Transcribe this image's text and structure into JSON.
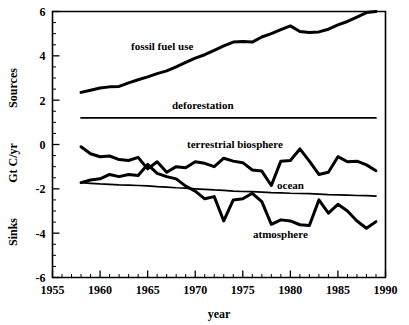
{
  "chart_data": {
    "type": "line",
    "title": "",
    "xlabel": "year",
    "ylabel": "Sinks   Gt C/yr   Sources",
    "ylabel_parts": [
      "Sinks",
      "Gt C/yr",
      "Sources"
    ],
    "xlim": [
      1955,
      1990
    ],
    "ylim": [
      -6,
      6
    ],
    "grid": false,
    "legend": "inline-annotations",
    "x_ticks_major": [
      1955,
      1960,
      1965,
      1970,
      1975,
      1980,
      1985,
      1990
    ],
    "x_tick_labels": [
      "1955",
      "1960",
      "1965",
      "1970",
      "1975",
      "1980",
      "1985",
      "1990"
    ],
    "x_tick_minor_step": 1,
    "y_ticks_major": [
      6,
      4,
      2,
      0,
      -2,
      -4,
      -6
    ],
    "y_tick_labels": [
      "6",
      "4",
      "2",
      "0",
      "-2",
      "-4",
      "-6"
    ],
    "y_tick_minor_step": 0.5,
    "x": [
      1958,
      1959,
      1960,
      1961,
      1962,
      1963,
      1964,
      1965,
      1966,
      1967,
      1968,
      1969,
      1970,
      1971,
      1972,
      1973,
      1974,
      1975,
      1976,
      1977,
      1978,
      1979,
      1980,
      1981,
      1982,
      1983,
      1984,
      1985,
      1986,
      1987,
      1988,
      1989
    ],
    "series": [
      {
        "name": "fossil fuel use",
        "label": "fossil fuel use",
        "style": "thick",
        "values": [
          2.35,
          2.45,
          2.55,
          2.6,
          2.62,
          2.78,
          2.92,
          3.05,
          3.2,
          3.32,
          3.5,
          3.7,
          3.9,
          4.05,
          4.25,
          4.45,
          4.62,
          4.65,
          4.62,
          4.85,
          5.0,
          5.18,
          5.35,
          5.1,
          5.05,
          5.08,
          5.2,
          5.4,
          5.55,
          5.75,
          5.95,
          6.0
        ]
      },
      {
        "name": "deforestation",
        "label": "deforestation",
        "style": "thin",
        "values": [
          1.2,
          1.2,
          1.2,
          1.2,
          1.2,
          1.2,
          1.2,
          1.2,
          1.2,
          1.2,
          1.2,
          1.2,
          1.2,
          1.2,
          1.2,
          1.2,
          1.2,
          1.2,
          1.2,
          1.2,
          1.2,
          1.2,
          1.2,
          1.2,
          1.2,
          1.2,
          1.2,
          1.2,
          1.2,
          1.2,
          1.2,
          1.2
        ]
      },
      {
        "name": "terrestrial biosphere",
        "label": "terrestrial biosphere",
        "style": "thick",
        "values": [
          -0.1,
          -0.42,
          -0.55,
          -0.52,
          -0.68,
          -0.72,
          -0.58,
          -1.1,
          -0.78,
          -1.25,
          -1.0,
          -1.05,
          -0.78,
          -0.85,
          -1.0,
          -0.62,
          -0.75,
          -0.82,
          -1.15,
          -1.2,
          -1.85,
          -0.75,
          -0.72,
          -0.2,
          -0.75,
          -1.35,
          -1.25,
          -0.55,
          -0.78,
          -0.75,
          -0.92,
          -1.18
        ]
      },
      {
        "name": "ocean",
        "label": "ocean",
        "style": "thin",
        "values": [
          -1.72,
          -1.75,
          -1.78,
          -1.8,
          -1.82,
          -1.83,
          -1.85,
          -1.87,
          -1.9,
          -1.92,
          -1.95,
          -1.97,
          -2.0,
          -2.02,
          -2.05,
          -2.07,
          -2.1,
          -2.12,
          -2.13,
          -2.15,
          -2.17,
          -2.18,
          -2.2,
          -2.21,
          -2.22,
          -2.24,
          -2.26,
          -2.27,
          -2.28,
          -2.3,
          -2.31,
          -2.33
        ]
      },
      {
        "name": "atmosphere",
        "label": "atmosphere",
        "style": "thick",
        "values": [
          -1.72,
          -1.6,
          -1.55,
          -1.35,
          -1.45,
          -1.35,
          -1.4,
          -0.9,
          -1.3,
          -1.45,
          -1.55,
          -1.88,
          -2.1,
          -2.45,
          -2.35,
          -3.45,
          -2.5,
          -2.45,
          -2.2,
          -2.58,
          -3.6,
          -3.4,
          -3.45,
          -3.62,
          -3.65,
          -2.5,
          -3.1,
          -2.7,
          -3.0,
          -3.45,
          -3.78,
          -3.48
        ]
      }
    ],
    "annotations": [
      {
        "text": "fossil fuel use",
        "x_px": 131,
        "y_px": 50
      },
      {
        "text": "deforestation",
        "x_px": 172,
        "y_px": 109
      },
      {
        "text": "terrestrial biosphere",
        "x_px": 187,
        "y_px": 148
      },
      {
        "text": "ocean",
        "x_px": 277,
        "y_px": 189
      },
      {
        "text": "atmosphere",
        "x_px": 253,
        "y_px": 238
      }
    ],
    "colors": {
      "line": "#000000",
      "axis": "#000000",
      "background": "#ffffff"
    }
  }
}
